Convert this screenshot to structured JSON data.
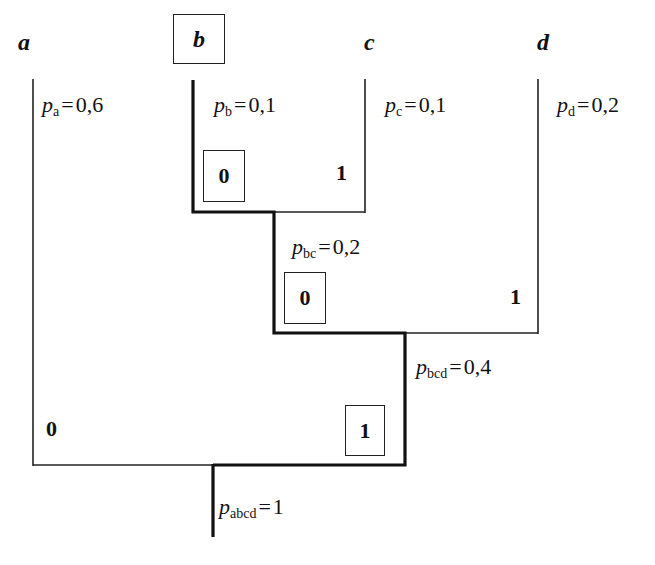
{
  "diagram": {
    "type": "huffman-code-tree",
    "symbols": [
      {
        "id": "a",
        "label": "a",
        "prob_sub": "a",
        "prob_value": "0,6",
        "code": "0"
      },
      {
        "id": "b",
        "label": "b",
        "prob_sub": "b",
        "prob_value": "0,1",
        "code": "100",
        "highlighted": true
      },
      {
        "id": "c",
        "label": "c",
        "prob_sub": "c",
        "prob_value": "0,1",
        "code": "101"
      },
      {
        "id": "d",
        "label": "d",
        "prob_sub": "d",
        "prob_value": "0,2",
        "code": "11"
      }
    ],
    "internal_nodes": [
      {
        "id": "bc",
        "prob_sub": "bc",
        "prob_value": "0,2",
        "left_bit": "0",
        "right_bit": "1"
      },
      {
        "id": "bcd",
        "prob_sub": "bcd",
        "prob_value": "0,4",
        "left_bit": "0",
        "right_bit": "1"
      },
      {
        "id": "abcd",
        "prob_sub": "abcd",
        "prob_value": "1",
        "left_bit": "0",
        "right_bit": "1"
      }
    ],
    "branch_bits": {
      "b_c": {
        "left": "0",
        "right": "1"
      },
      "bc_d": {
        "left": "0",
        "right": "1"
      },
      "a_bcd": {
        "left": "0",
        "right": "1"
      }
    },
    "p_symbol": "p",
    "eq": "=",
    "highlight_path": "b → bc → bcd → abcd (code 100)"
  }
}
